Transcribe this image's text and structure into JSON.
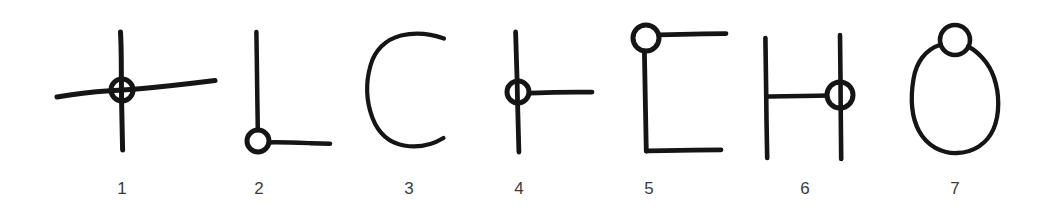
{
  "figure": {
    "background_color": "#ffffff",
    "ink_color": "#151515",
    "caption_color": "#3b3b3b",
    "width": 1060,
    "height": 221,
    "items": [
      {
        "number": "1",
        "name": "cross-with-circle-at-intersection",
        "caption_x": 122,
        "marker": "circle",
        "marker_center": [
          122,
          90
        ],
        "marker_radius": 11
      },
      {
        "number": "2",
        "name": "corner-ell-with-circle-at-vertex",
        "caption_x": 259,
        "marker": "circle",
        "marker_center": [
          258,
          141
        ],
        "marker_radius": 11
      },
      {
        "number": "3",
        "name": "open-arc-c-shape-no-circle",
        "caption_x": 409,
        "marker": "none",
        "marker_center": null,
        "marker_radius": 0
      },
      {
        "number": "4",
        "name": "tee-junction-with-circle",
        "caption_x": 519,
        "marker": "circle",
        "marker_center": [
          518,
          92
        ],
        "marker_radius": 11
      },
      {
        "number": "5",
        "name": "bracket-with-circle-at-top-corner",
        "caption_x": 649,
        "marker": "circle",
        "marker_center": [
          646,
          38
        ],
        "marker_radius": 13
      },
      {
        "number": "6",
        "name": "h-shape-with-circle-on-right-bar",
        "caption_x": 805,
        "marker": "circle",
        "marker_center": [
          840,
          95
        ],
        "marker_radius": 13
      },
      {
        "number": "7",
        "name": "oval-with-circle-on-top-edge",
        "caption_x": 955,
        "marker": "circle",
        "marker_center": [
          955,
          40
        ],
        "marker_radius": 15
      }
    ]
  }
}
